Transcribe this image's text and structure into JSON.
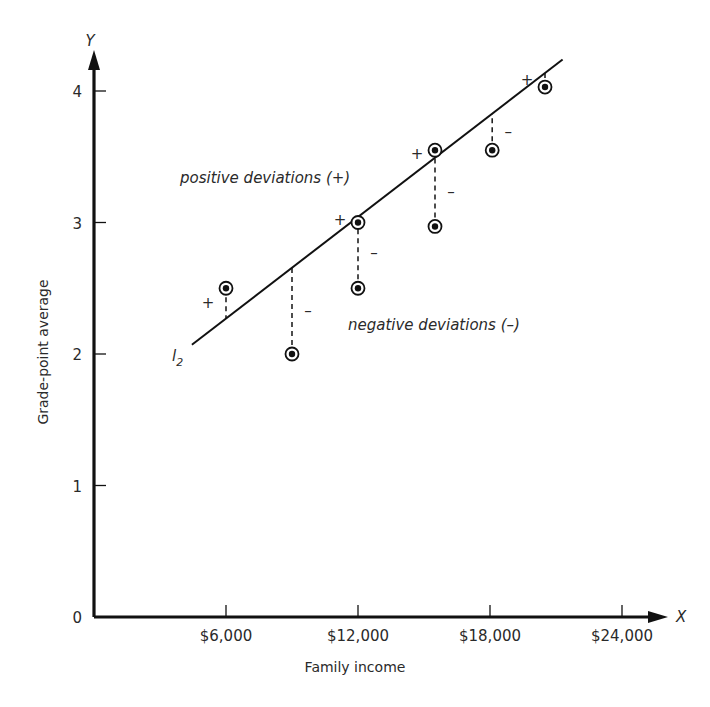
{
  "chart_data": {
    "type": "scatter",
    "title": "",
    "xlabel": "Family income",
    "ylabel": "Grade-point average",
    "x_axis_letter": "X",
    "y_axis_letter": "Y",
    "origin_label": "0",
    "xlim": [
      0,
      25500
    ],
    "ylim": [
      0,
      4.4
    ],
    "x_ticks": [
      6000,
      12000,
      18000,
      24000
    ],
    "x_tick_labels": [
      "$6,000",
      "$12,000",
      "$18,000",
      "$24,000"
    ],
    "y_ticks": [
      1,
      2,
      3,
      4
    ],
    "y_tick_labels": [
      "1",
      "2",
      "3",
      "4"
    ],
    "grid": false,
    "legend": null,
    "points": [
      {
        "x": 6000,
        "y": 2.5,
        "deviation": "+"
      },
      {
        "x": 9000,
        "y": 2.0,
        "deviation": "−"
      },
      {
        "x": 12000,
        "y": 3.0,
        "deviation": "+"
      },
      {
        "x": 12000,
        "y": 2.5,
        "deviation": "−"
      },
      {
        "x": 15500,
        "y": 3.55,
        "deviation": "+"
      },
      {
        "x": 15500,
        "y": 2.97,
        "deviation": "−"
      },
      {
        "x": 18100,
        "y": 3.55,
        "deviation": "−"
      },
      {
        "x": 20500,
        "y": 4.03,
        "deviation": "+"
      }
    ],
    "regression_line": {
      "label": "l",
      "label_subscript": "2",
      "x_start": 4450,
      "y_start": 2.07,
      "x_end": 21300,
      "y_end": 4.24
    },
    "annotations": [
      {
        "text": "positive deviations (+)"
      },
      {
        "text": "negative deviations (–)"
      }
    ]
  },
  "labels": {
    "positive": "positive deviations (+)",
    "negative": "negative deviations (–)",
    "plus": "+",
    "minus": "–"
  }
}
